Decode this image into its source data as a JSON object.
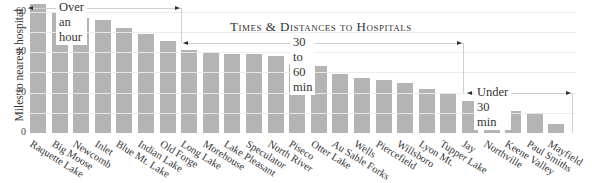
{
  "chart_data": {
    "type": "bar",
    "title": "Times & Distances to Hospitals",
    "xlabel": "",
    "ylabel": "Miles to nearest hospital",
    "ylim": [
      0,
      65
    ],
    "yticks": [
      0,
      20,
      40,
      60
    ],
    "grid": true,
    "gridlines": [
      10,
      20,
      30,
      40,
      50,
      60
    ],
    "categories": [
      "Raquette Lake",
      "Big Moose",
      "Newcomb",
      "Inlet",
      "Blue Mt. Lake",
      "Indian Lake",
      "Old Forge",
      "Long Lake",
      "Morehouse",
      "Lake Pleasant",
      "Speculator",
      "North River",
      "Piseco",
      "Otter Lake",
      "Au Sable Forks",
      "Wells",
      "Piercefield",
      "Willsboro",
      "Lyon Mt.",
      "Tupper Lake",
      "Jay",
      "Northville",
      "Keene Valley",
      "Paul Smiths",
      "Mayfield"
    ],
    "values": [
      64,
      60,
      57,
      56,
      52,
      49,
      45.5,
      41,
      40,
      39,
      39,
      38,
      34,
      33,
      29,
      27,
      26,
      25,
      22,
      20,
      16,
      13,
      11,
      10,
      4.5
    ],
    "annotations": [
      {
        "label": "Over an hour",
        "from_index": 0,
        "to_index": 6
      },
      {
        "label": "30 to 60 min",
        "from_index": 7,
        "to_index": 19
      },
      {
        "label": "Under 30 min",
        "from_index": 20,
        "to_index": 24
      }
    ],
    "bar_color": "#b4b4b4"
  }
}
